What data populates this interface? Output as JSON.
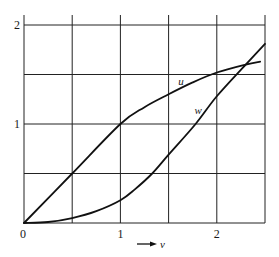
{
  "chart_data": {
    "type": "line",
    "title": "",
    "xlabel": "v",
    "ylabel": "",
    "xlim": [
      0,
      2.5
    ],
    "ylim": [
      0,
      2
    ],
    "grid": true,
    "grid_step_x": 0.5,
    "grid_step_y": 0.5,
    "x_ticks": [
      {
        "value": 0,
        "label": "0"
      },
      {
        "value": 1,
        "label": "1"
      },
      {
        "value": 2,
        "label": "2"
      }
    ],
    "y_ticks": [
      {
        "value": 1,
        "label": "1"
      },
      {
        "value": 2,
        "label": "2"
      }
    ],
    "legend": "inline labels",
    "series": [
      {
        "name": "u",
        "label_at": [
          1.63,
          1.42
        ],
        "x": [
          0,
          0.5,
          1.0,
          1.25,
          1.5,
          1.75,
          2.0,
          2.3,
          2.45
        ],
        "values": [
          0,
          0.5,
          1.0,
          1.17,
          1.3,
          1.42,
          1.52,
          1.6,
          1.63
        ]
      },
      {
        "name": "w",
        "label_at": [
          1.8,
          1.13
        ],
        "x": [
          0,
          0.25,
          0.5,
          0.75,
          1.0,
          1.15,
          1.33,
          1.5,
          1.78,
          2.0,
          2.3,
          2.5
        ],
        "values": [
          0,
          0.01,
          0.05,
          0.12,
          0.23,
          0.34,
          0.5,
          0.69,
          1.0,
          1.28,
          1.6,
          1.81
        ]
      }
    ],
    "annotations": [
      {
        "text": "v",
        "type": "axis-arrow",
        "description": "arrow pointing right labelled v below the x-axis"
      }
    ],
    "colors": {
      "line": "#111111",
      "grid": "#222222",
      "background": "#ffffff"
    }
  }
}
